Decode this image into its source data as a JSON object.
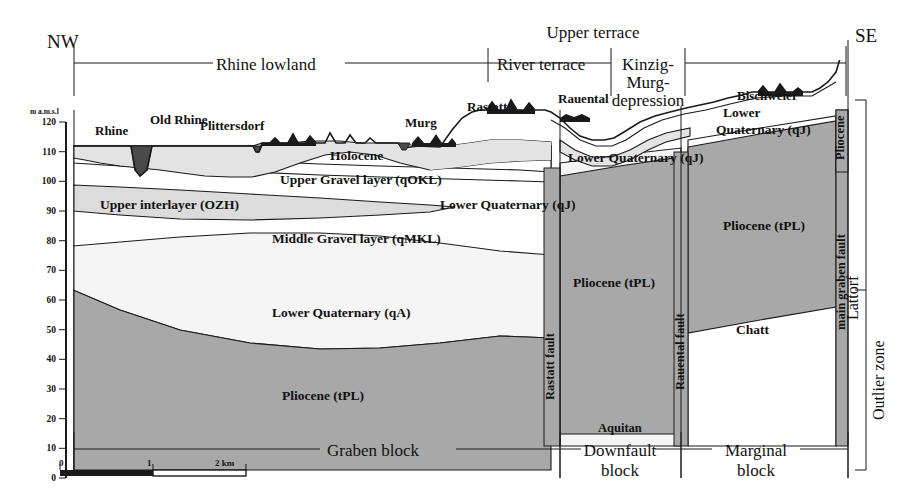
{
  "figure": {
    "type": "geological-cross-section",
    "orientation_left": "NW",
    "orientation_right": "SE"
  },
  "axis": {
    "caption": "m a.m.s.l",
    "ticks": [
      "120",
      "110",
      "100",
      "90",
      "80",
      "70",
      "60",
      "50",
      "40",
      "30",
      "20",
      "10",
      "0"
    ],
    "min": 0,
    "max": 120,
    "step": 10
  },
  "scalebar": {
    "ticks": [
      "0",
      "1",
      "2 km"
    ],
    "length_km": 2
  },
  "top_zones": [
    {
      "label": "Rhine lowland"
    },
    {
      "label": "River terrace"
    },
    {
      "label": "Upper terrace"
    },
    {
      "label": "Kinzig-"
    },
    {
      "label": "Murg-"
    },
    {
      "label": "depression"
    }
  ],
  "bottom_zones": [
    {
      "label": "Graben block"
    },
    {
      "label": "Downfault"
    },
    {
      "label": "block"
    },
    {
      "label": "Marginal"
    },
    {
      "label": "block"
    }
  ],
  "places": [
    {
      "label": "Rhine"
    },
    {
      "label": "Old Rhine"
    },
    {
      "label": "Plittersdorf"
    },
    {
      "label": "Murg"
    },
    {
      "label": "Rastatt"
    },
    {
      "label": "Rauental"
    },
    {
      "label": "Bischweier"
    }
  ],
  "strata": [
    {
      "label": "Holocene"
    },
    {
      "label": "Upper Gravel layer (qOKL)"
    },
    {
      "label": "Upper interlayer (OZH)"
    },
    {
      "label": "Lower Quaternary (qJ)"
    },
    {
      "label": "Middle Gravel layer (qMKL)"
    },
    {
      "label": "Lower Quaternary (qA)"
    },
    {
      "label": "Pliocene (tPL)"
    },
    {
      "label": "Lower"
    },
    {
      "label": "Quaternary (qJ)"
    },
    {
      "label": "Lower Quaternary (qJ)"
    },
    {
      "label": "Pliocene (tPL)"
    },
    {
      "label": "Pliocene (tPL)"
    },
    {
      "label": "Chatt"
    },
    {
      "label": "Aquitan"
    },
    {
      "label": "Pliocene"
    },
    {
      "label": "Lattorf"
    }
  ],
  "faults": [
    {
      "label": "Rastatt fault"
    },
    {
      "label": "Rauental fault"
    },
    {
      "label": "main graben fault"
    }
  ],
  "side_zones": [
    {
      "label": "Outlier zone"
    }
  ],
  "colors": {
    "holocene_fill": "#e3e3e3",
    "gravel_fill": "#ffffff",
    "interlayer_fill": "#dcdcdc",
    "quaternary_fill": "#f4f4f4",
    "pliocene_fill": "#a8a8a8",
    "river_fill": "#4a4a4a",
    "outline": "#1a1a1a",
    "fault_band": "#a8a8a8",
    "background": "#ffffff"
  }
}
